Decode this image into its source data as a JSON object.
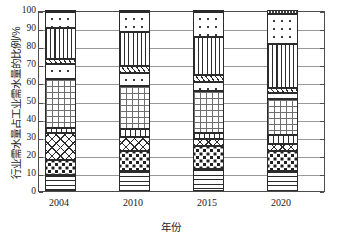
{
  "chart_data": {
    "type": "bar",
    "subtype": "stacked-bar-100-percent",
    "title": "",
    "xlabel": "年份",
    "ylabel": "行业需水量占工业需水量的比例/%",
    "categories": [
      "2004",
      "2010",
      "2015",
      "2020"
    ],
    "ylim": [
      0,
      100
    ],
    "ytick_labels": [
      "0",
      "10",
      "20",
      "30",
      "40",
      "50",
      "60",
      "70",
      "80",
      "90",
      "100"
    ],
    "ytick_values": [
      0,
      10,
      20,
      30,
      40,
      50,
      60,
      70,
      80,
      90,
      100
    ],
    "grid": "horizontal",
    "legend": "none",
    "series": [
      {
        "name": "segment-1",
        "pattern": "horizontal-lines",
        "values": [
          9,
          11,
          12,
          11
        ]
      },
      {
        "name": "segment-2",
        "pattern": "coarse-dots",
        "values": [
          8,
          11,
          13,
          11
        ]
      },
      {
        "name": "segment-3",
        "pattern": "cross-hatch",
        "values": [
          15,
          8,
          4,
          4
        ]
      },
      {
        "name": "segment-4",
        "pattern": "comb-ticks",
        "values": [
          3,
          4,
          3,
          5
        ]
      },
      {
        "name": "segment-5",
        "pattern": "fine-grid",
        "values": [
          27,
          24,
          23,
          20
        ]
      },
      {
        "name": "segment-6",
        "pattern": "sparse-dots",
        "values": [
          8,
          7,
          5,
          3
        ]
      },
      {
        "name": "segment-7",
        "pattern": "diagonal-hatch",
        "values": [
          3,
          4,
          4,
          3
        ]
      },
      {
        "name": "segment-8",
        "pattern": "vertical-lines",
        "values": [
          17,
          19,
          21,
          24
        ]
      },
      {
        "name": "segment-9",
        "pattern": "sparse-dots",
        "values": [
          9,
          11,
          14,
          17
        ]
      },
      {
        "name": "segment-10",
        "pattern": "solid-dark",
        "values": [
          1,
          1,
          1,
          2
        ]
      }
    ],
    "cumulative_tops": {
      "2004": [
        9,
        17,
        32,
        35,
        62,
        70,
        73,
        90,
        99,
        100
      ],
      "2010": [
        11,
        22,
        30,
        34,
        58,
        65,
        69,
        88,
        99,
        100
      ],
      "2015": [
        12,
        25,
        29,
        32,
        55,
        60,
        64,
        85,
        99,
        100
      ],
      "2020": [
        11,
        22,
        26,
        31,
        51,
        54,
        57,
        81,
        98,
        100
      ]
    }
  },
  "axes": {
    "ylabel": "行业需水量占工业需水量的比例/%",
    "xlabel": "年份",
    "yticks": [
      "100",
      "90",
      "80",
      "70",
      "60",
      "50",
      "40",
      "30",
      "20",
      "10",
      "0"
    ],
    "xticks": [
      "2004",
      "2010",
      "2015",
      "2020"
    ]
  }
}
